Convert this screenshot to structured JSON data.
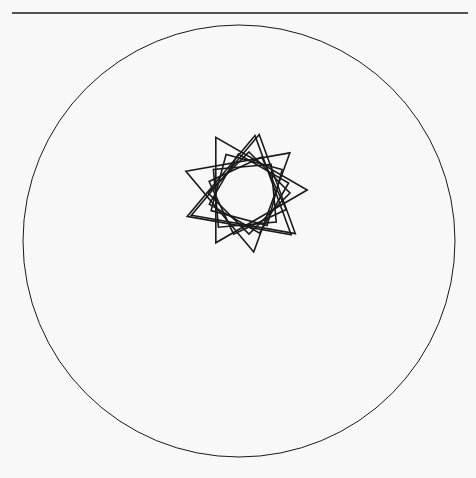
{
  "colors": {
    "background": "#f8f8f8",
    "stroke": "#1a1a1a"
  },
  "top_rule": {
    "x1": 12,
    "x2": 468,
    "y": 13,
    "width": 1.5
  },
  "outer_circle": {
    "cx": 239,
    "cy": 241,
    "r": 216,
    "width": 1
  },
  "rosette": {
    "cx": 246,
    "cy": 193,
    "inner_r": 29,
    "count": 9,
    "shapes": [
      {
        "type": "square",
        "side": 58,
        "rotation": 0
      },
      {
        "type": "square",
        "side": 60,
        "rotation": 20
      },
      {
        "type": "square",
        "side": 62,
        "rotation": 40
      },
      {
        "type": "triangle",
        "side": 72,
        "rotation": 10
      },
      {
        "type": "triangle",
        "side": 74,
        "rotation": 50
      },
      {
        "type": "triangle",
        "side": 76,
        "rotation": 90
      },
      {
        "type": "square",
        "side": 58,
        "rotation": 60
      },
      {
        "type": "triangle",
        "side": 70,
        "rotation": 130
      },
      {
        "type": "square",
        "side": 60,
        "rotation": 75
      }
    ],
    "stroke_width": 1.6
  }
}
